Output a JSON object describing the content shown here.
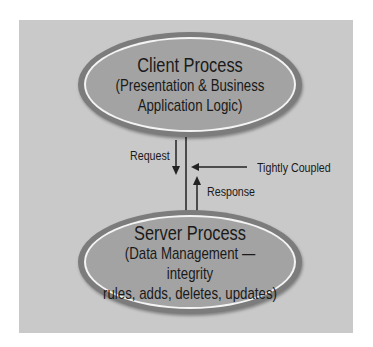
{
  "diagram": {
    "client": {
      "title": "Client Process",
      "line1": "(Presentation & Business",
      "line2": "Application Logic)"
    },
    "server": {
      "title": "Server Process",
      "line1": "(Data Management — integrity",
      "line2": "rules, adds, deletes, updates)"
    },
    "labels": {
      "request": "Request",
      "response": "Response",
      "tightly_coupled": "Tightly Coupled"
    },
    "colors": {
      "panel": "#c9c9c9",
      "ellipse_fill": "#a3a3a3",
      "ellipse_border": "#7c7c7c",
      "ring": "#f4f4f4",
      "text": "#1a1a1a"
    }
  }
}
